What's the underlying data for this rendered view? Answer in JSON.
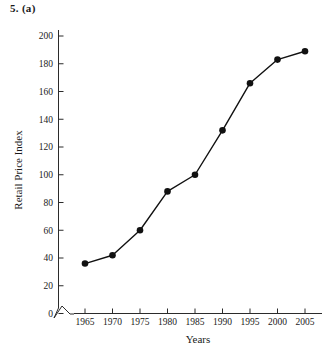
{
  "figure": {
    "question_label": "5. (a)"
  },
  "chart_data": {
    "type": "line",
    "title": "",
    "xlabel": "Years",
    "ylabel": "Retail Price Index",
    "categories": [
      1965,
      1970,
      1975,
      1980,
      1985,
      1990,
      1995,
      2000,
      2005
    ],
    "x": [
      1965,
      1970,
      1975,
      1980,
      1985,
      1990,
      1995,
      2000,
      2005
    ],
    "values": [
      36,
      42,
      60,
      88,
      100,
      132,
      166,
      183,
      189
    ],
    "series": [
      {
        "name": "Retail Price Index",
        "values": [
          36,
          42,
          60,
          88,
          100,
          132,
          166,
          183,
          189
        ]
      }
    ],
    "xtick_labels": [
      "1965",
      "1970",
      "1975",
      "1980",
      "1985",
      "1990",
      "1995",
      "2000",
      "2005"
    ],
    "ytick_labels": [
      "0",
      "20",
      "40",
      "60",
      "80",
      "100",
      "120",
      "140",
      "160",
      "180",
      "200"
    ],
    "yticks": [
      0,
      20,
      40,
      60,
      80,
      100,
      120,
      140,
      160,
      180,
      200
    ],
    "xlim": [
      1962.5,
      2007.5
    ],
    "ylim": [
      0,
      200
    ],
    "grid": false,
    "legend": false,
    "marker": "filled-circle",
    "line_color": "#111111",
    "marker_color": "#111111",
    "axis_color": "#2b2b2b",
    "axis_break": "y-axis-break-at-origin"
  }
}
